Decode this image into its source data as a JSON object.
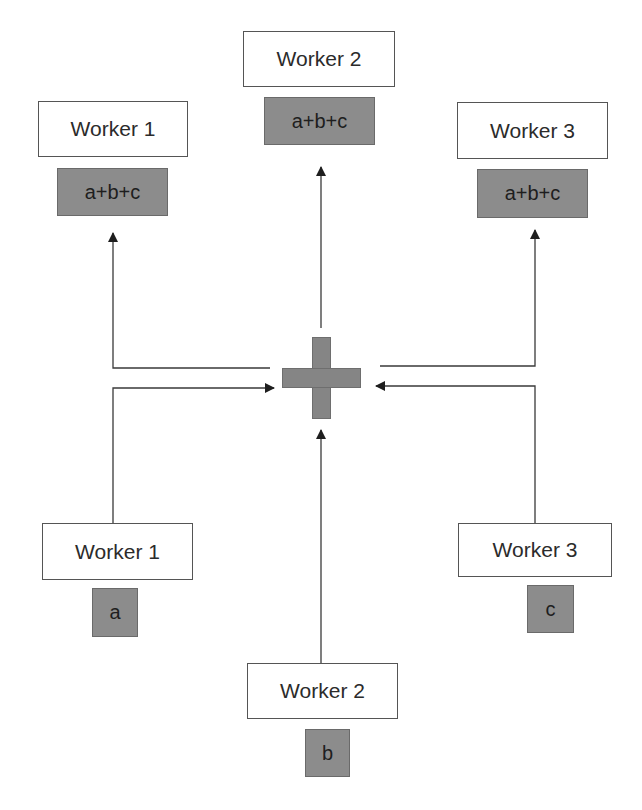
{
  "diagram": {
    "operator": {
      "icon": "plus-icon",
      "color": "#858585"
    },
    "outputs": [
      {
        "worker": "Worker 1",
        "value": "a+b+c"
      },
      {
        "worker": "Worker 2",
        "value": "a+b+c"
      },
      {
        "worker": "Worker 3",
        "value": "a+b+c"
      }
    ],
    "inputs": [
      {
        "worker": "Worker 1",
        "value": "a"
      },
      {
        "worker": "Worker 2",
        "value": "b"
      },
      {
        "worker": "Worker 3",
        "value": "c"
      }
    ],
    "colors": {
      "box_border": "#555555",
      "value_fill": "#8c8c8c",
      "line": "#3a3a3a"
    }
  }
}
